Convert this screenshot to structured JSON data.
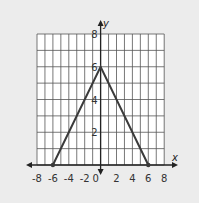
{
  "chart_data": {
    "type": "line",
    "title": "",
    "xlabel": "x",
    "ylabel": "y",
    "xlim": [
      -8,
      8
    ],
    "ylim": [
      0,
      8
    ],
    "grid": true,
    "x_ticks": [
      -8,
      -6,
      -4,
      -2,
      0,
      2,
      4,
      6,
      8
    ],
    "x_tick_labels": [
      "-8",
      "-6",
      "-4",
      "-2",
      "0",
      "2",
      "4",
      "6",
      "8"
    ],
    "y_ticks": [
      2,
      4,
      6,
      8
    ],
    "y_tick_labels": [
      "2",
      "4",
      "6",
      "8"
    ],
    "series": [
      {
        "name": "graph",
        "x": [
          -6,
          0,
          6
        ],
        "y": [
          0,
          6,
          0
        ],
        "color": "#3a3a3a"
      }
    ],
    "endpoints": [
      [
        -6,
        0
      ],
      [
        6,
        0
      ]
    ]
  },
  "colors": {
    "background": "#ececec",
    "grid_fill": "#ffffff",
    "grid_line": "#555555",
    "axis": "#222222",
    "line": "#3a3a3a"
  }
}
